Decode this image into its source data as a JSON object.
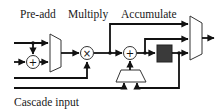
{
  "labels": {
    "preadd": "Pre-add",
    "multiply": "Multiply",
    "accumulate": "Accumulate",
    "cascade": "Cascade input"
  },
  "blocks": {
    "preadd_adder_symbol": "+",
    "multiplier_symbol": "×",
    "accumulate_adder_symbol": "+"
  },
  "colors": {
    "wire": "#111111",
    "register_fill": "#3a3a3a",
    "background": "#ffffff"
  }
}
